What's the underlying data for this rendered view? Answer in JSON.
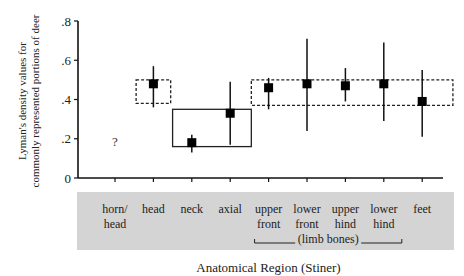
{
  "chart_data": {
    "type": "scatter",
    "subtype": "point-with-error-bars",
    "title": "",
    "xlabel": "Anatomical Region (Stiner)",
    "ylabel_lines": [
      "Lyman's density values for",
      "commonly represented portions of deer"
    ],
    "ylim": [
      0,
      0.8
    ],
    "yticks": [
      0,
      0.2,
      0.4,
      0.6,
      0.8
    ],
    "ytick_labels": [
      "0",
      ".2",
      ".4",
      ".6",
      ".8"
    ],
    "grid": false,
    "categories": [
      {
        "line1": "horn/",
        "line2": "head"
      },
      {
        "line1": "head",
        "line2": ""
      },
      {
        "line1": "neck",
        "line2": ""
      },
      {
        "line1": "axial",
        "line2": ""
      },
      {
        "line1": "upper",
        "line2": "front"
      },
      {
        "line1": "lower",
        "line2": "front"
      },
      {
        "line1": "upper",
        "line2": "hind"
      },
      {
        "line1": "lower",
        "line2": "hind"
      },
      {
        "line1": "feet",
        "line2": ""
      }
    ],
    "group_bracket": {
      "label": "(limb bones)",
      "from_category": 4,
      "to_category": 7
    },
    "series": [
      {
        "name": "density",
        "points": [
          {
            "category": 0,
            "value": null,
            "low": null,
            "high": null,
            "annotation": "?",
            "annotation_y": 0.19
          },
          {
            "category": 1,
            "value": 0.48,
            "low": 0.36,
            "high": 0.57
          },
          {
            "category": 2,
            "value": 0.18,
            "low": 0.13,
            "high": 0.22
          },
          {
            "category": 3,
            "value": 0.33,
            "low": 0.17,
            "high": 0.49
          },
          {
            "category": 4,
            "value": 0.46,
            "low": 0.35,
            "high": 0.51
          },
          {
            "category": 5,
            "value": 0.48,
            "low": 0.24,
            "high": 0.71
          },
          {
            "category": 6,
            "value": 0.47,
            "low": 0.39,
            "high": 0.56
          },
          {
            "category": 7,
            "value": 0.48,
            "low": 0.29,
            "high": 0.69
          },
          {
            "category": 8,
            "value": 0.39,
            "low": 0.21,
            "high": 0.55
          }
        ]
      }
    ],
    "range_boxes": [
      {
        "style": "dashed",
        "from_category": 0.55,
        "to_category": 1.45,
        "low": 0.38,
        "high": 0.5
      },
      {
        "style": "solid",
        "from_category": 1.5,
        "to_category": 3.55,
        "low": 0.16,
        "high": 0.35
      },
      {
        "style": "dashed",
        "from_category": 3.55,
        "to_category": 8.8,
        "low": 0.37,
        "high": 0.5
      }
    ],
    "category_band_color": "#d4d4d4"
  }
}
